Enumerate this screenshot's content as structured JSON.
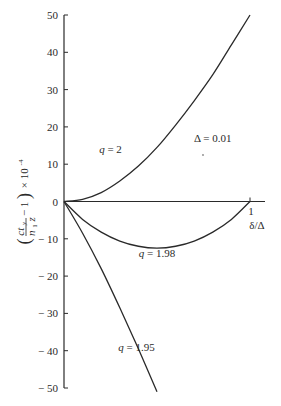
{
  "chart_data": {
    "type": "line",
    "title": "",
    "xlabel": "δ/Δ",
    "ylabel": "(c t_y / n_1 z − 1) × 10^-4",
    "ylabel_parts": {
      "open": "(",
      "num": "ct",
      "num_sub": "y",
      "den": "n",
      "den_sub": "1",
      "den_tail": "z",
      "minus": "− 1",
      "close": ")",
      "mult": "× 10",
      "exp": "-4"
    },
    "xlim": [
      0,
      1
    ],
    "ylim": [
      -50,
      50
    ],
    "x_ticks": [
      1
    ],
    "x_tick_labels": [
      "1"
    ],
    "y_ticks": [
      50,
      40,
      30,
      20,
      10,
      0,
      -10,
      -20,
      -30,
      -40,
      -50
    ],
    "y_tick_labels": [
      "50",
      "40",
      "30",
      "20",
      "10",
      "0",
      "− 10",
      "− 20",
      "− 30",
      "− 40",
      "− 50"
    ],
    "grid": false,
    "legend": "none (curves labeled inline)",
    "annotations": [
      {
        "text": "Δ = 0.01",
        "x": 0.8,
        "y": 16
      },
      {
        "text": "q = 2",
        "x": 0.25,
        "y": 13
      },
      {
        "text": "q = 1.98",
        "x": 0.5,
        "y": -15
      },
      {
        "text": "q = 1.95",
        "x": 0.39,
        "y": -40
      }
    ],
    "series": [
      {
        "name": "q = 2",
        "x": [
          0,
          0.1,
          0.2,
          0.3,
          0.4,
          0.5,
          0.6,
          0.7,
          0.8,
          0.9,
          1.0
        ],
        "y": [
          0,
          0.6,
          2.4,
          5.5,
          9.5,
          14.5,
          20.5,
          27,
          34,
          42,
          50
        ]
      },
      {
        "name": "q = 1.98",
        "x": [
          0,
          0.1,
          0.2,
          0.3,
          0.4,
          0.5,
          0.6,
          0.7,
          0.8,
          0.9,
          1.0
        ],
        "y": [
          0,
          -4.8,
          -8.2,
          -10.6,
          -12.0,
          -12.5,
          -12.0,
          -10.6,
          -8.2,
          -4.8,
          0
        ]
      },
      {
        "name": "q = 1.95",
        "x": [
          0,
          0.1,
          0.2,
          0.3,
          0.4,
          0.5
        ],
        "y": [
          0,
          -8.5,
          -18,
          -28.5,
          -39.5,
          -51
        ]
      }
    ]
  }
}
